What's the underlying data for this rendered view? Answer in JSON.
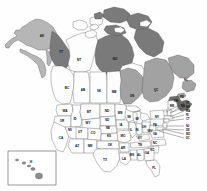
{
  "map": {
    "title": "North America state and province map",
    "background_color": "#ffffff",
    "border_color": "#4a4a4a",
    "palette": {
      "white": "#fdfdfd",
      "light_gray": "#b6b6b6",
      "medium_gray": "#a2a2a2",
      "dark_gray": "#7a7a7a",
      "darker_gray": "#6a6a6a",
      "label_text": "#111111"
    },
    "inset": {
      "name": "hawaii-inset",
      "label": "HI",
      "border_color": "#555555"
    },
    "canada": [
      {
        "code": "AK",
        "fill": "light_gray",
        "x": 42,
        "y": 36
      },
      {
        "code": "YT",
        "fill": "dark_gray",
        "x": 61,
        "y": 52
      },
      {
        "code": "NT",
        "fill": "white",
        "x": 79,
        "y": 60
      },
      {
        "code": "NU",
        "fill": "dark_gray",
        "x": 115,
        "y": 59
      },
      {
        "code": "BC",
        "fill": "white",
        "x": 67,
        "y": 88
      },
      {
        "code": "AB",
        "fill": "white",
        "x": 83,
        "y": 90
      },
      {
        "code": "SK",
        "fill": "white",
        "x": 99,
        "y": 91
      },
      {
        "code": "MB",
        "fill": "white",
        "x": 114,
        "y": 92
      },
      {
        "code": "ON",
        "fill": "medium_gray",
        "x": 132,
        "y": 96
      },
      {
        "code": "QC",
        "fill": "medium_gray",
        "x": 156,
        "y": 90
      },
      {
        "code": "NL",
        "fill": "medium_gray",
        "x": 186,
        "y": 80
      },
      {
        "code": "NB",
        "fill": "darker_gray",
        "x": 176,
        "y": 101
      },
      {
        "code": "NS",
        "fill": "darker_gray",
        "x": 183,
        "y": 106
      },
      {
        "code": "PE",
        "fill": "medium_gray",
        "x": 182,
        "y": 97
      }
    ],
    "united_states": [
      {
        "code": "WA",
        "x": 65,
        "y": 111
      },
      {
        "code": "OR",
        "x": 62,
        "y": 121
      },
      {
        "code": "ID",
        "x": 75,
        "y": 119
      },
      {
        "code": "MT",
        "x": 89,
        "y": 112
      },
      {
        "code": "ND",
        "x": 107,
        "y": 111
      },
      {
        "code": "SD",
        "x": 107,
        "y": 120
      },
      {
        "code": "WY",
        "x": 88,
        "y": 123
      },
      {
        "code": "NE",
        "x": 108,
        "y": 128
      },
      {
        "code": "CA",
        "x": 61,
        "y": 138
      },
      {
        "code": "NV",
        "x": 70,
        "y": 130
      },
      {
        "code": "UT",
        "x": 80,
        "y": 132
      },
      {
        "code": "CO",
        "x": 93,
        "y": 133
      },
      {
        "code": "KS",
        "x": 109,
        "y": 136
      },
      {
        "code": "AZ",
        "x": 77,
        "y": 146
      },
      {
        "code": "NM",
        "x": 90,
        "y": 146
      },
      {
        "code": "OK",
        "x": 110,
        "y": 145
      },
      {
        "code": "TX",
        "x": 105,
        "y": 160
      },
      {
        "code": "MN",
        "x": 120,
        "y": 113
      },
      {
        "code": "IA",
        "x": 121,
        "y": 125
      },
      {
        "code": "MO",
        "x": 123,
        "y": 136
      },
      {
        "code": "AR",
        "x": 123,
        "y": 148
      },
      {
        "code": "LA",
        "x": 124,
        "y": 159
      },
      {
        "code": "WI",
        "x": 129,
        "y": 117
      },
      {
        "code": "IL",
        "x": 131,
        "y": 130
      },
      {
        "code": "MS",
        "x": 132,
        "y": 155
      },
      {
        "code": "MI",
        "x": 137,
        "y": 119
      },
      {
        "code": "IN",
        "x": 137,
        "y": 130
      },
      {
        "code": "KY",
        "x": 140,
        "y": 138
      },
      {
        "code": "TN",
        "x": 140,
        "y": 145
      },
      {
        "code": "AL",
        "x": 139,
        "y": 155
      },
      {
        "code": "OH",
        "x": 144,
        "y": 127
      },
      {
        "code": "WV",
        "x": 150,
        "y": 131
      },
      {
        "code": "VA",
        "x": 155,
        "y": 134
      },
      {
        "code": "NC",
        "x": 155,
        "y": 143
      },
      {
        "code": "SC",
        "x": 152,
        "y": 150
      },
      {
        "code": "GA",
        "x": 147,
        "y": 153
      },
      {
        "code": "FL",
        "x": 154,
        "y": 168
      },
      {
        "code": "PA",
        "x": 155,
        "y": 125
      },
      {
        "code": "NY",
        "x": 157,
        "y": 117
      },
      {
        "code": "ME",
        "x": 172,
        "y": 106
      }
    ],
    "leader_labels": [
      {
        "code": "VT",
        "x": 186,
        "y": 103
      },
      {
        "code": "NH",
        "x": 186,
        "y": 107
      },
      {
        "code": "MA",
        "x": 186,
        "y": 111
      },
      {
        "code": "RI",
        "x": 186,
        "y": 115
      },
      {
        "code": "CT",
        "x": 186,
        "y": 119
      },
      {
        "code": "NJ",
        "x": 186,
        "y": 126
      },
      {
        "code": "DE",
        "x": 186,
        "y": 130
      },
      {
        "code": "MD",
        "x": 186,
        "y": 134
      },
      {
        "code": "DC",
        "x": 186,
        "y": 138
      }
    ]
  }
}
